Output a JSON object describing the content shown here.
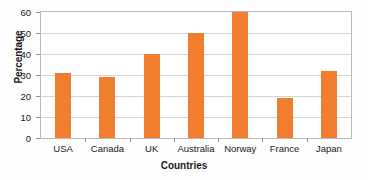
{
  "chart_data": {
    "type": "bar",
    "title": "",
    "xlabel": "Countries",
    "ylabel": "Percentage",
    "categories": [
      "USA",
      "Canada",
      "UK",
      "Australia",
      "Norway",
      "France",
      "Japan"
    ],
    "values": [
      31,
      29,
      40,
      50,
      60,
      19,
      32
    ],
    "ylim": [
      0,
      60
    ],
    "ytick_labels": [
      "0",
      "10",
      "20",
      "30",
      "40",
      "50",
      "60"
    ],
    "ytick_values": [
      0,
      10,
      20,
      30,
      40,
      50,
      60
    ],
    "grid": true,
    "legend": false,
    "legend_position": "none",
    "series": [
      {
        "name": "Percentage",
        "color": "#f07e2e",
        "values": [
          31,
          29,
          40,
          50,
          60,
          19,
          32
        ]
      }
    ]
  },
  "colors": {
    "bar": "#f07e2e",
    "gridline": "#d4d4d4",
    "axis": "#b9b9b9",
    "text": "#1a1a1a",
    "background": "#fdfdfd",
    "plot_background": "#ffffff"
  }
}
